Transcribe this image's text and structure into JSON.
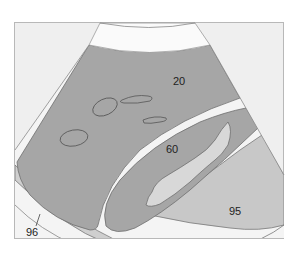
{
  "diagram": {
    "type": "ultrasound-schematic",
    "colors": {
      "background": "#ffffff",
      "frame_fill": "#efefef",
      "frame_stroke": "#b8b8b8",
      "near_field": "#fafafa",
      "parenchyma": "#a6a6a6",
      "parenchyma_stroke": "#6e6e6e",
      "separator": "#f7f7f7",
      "lumen": "#d8d8d8",
      "region_95": "#c8c8c8",
      "band_96": "#cfcfcf",
      "outline": "#555555"
    },
    "labels": {
      "l20": "20",
      "l60": "60",
      "l95": "95",
      "l96": "96"
    },
    "structures": [
      {
        "id": "20",
        "description": "upper dark parenchyma region with small oval outlines"
      },
      {
        "id": "60",
        "description": "middle elongated structure with light irregular lumen"
      },
      {
        "id": "95",
        "description": "lower right lighter region"
      },
      {
        "id": "96",
        "description": "lower left curved band with pointer line"
      }
    ]
  }
}
